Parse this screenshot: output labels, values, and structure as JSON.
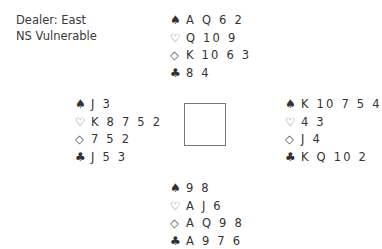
{
  "deal_info": {
    "dealer": "Dealer: East",
    "vulnerability": "NS Vulnerable"
  },
  "suits": {
    "spades": "♠",
    "hearts": "♡",
    "diamonds": "◇",
    "clubs": "♣"
  },
  "hands": {
    "north": {
      "spades": "A Q 6 2",
      "hearts": "Q 10 9",
      "diamonds": "K 10 6 3",
      "clubs": "8 4"
    },
    "west": {
      "spades": "J 3",
      "hearts": "K 8 7 5 2",
      "diamonds": "7 5 2",
      "clubs": "J 5 3"
    },
    "east": {
      "spades": "K 10 7 5 4",
      "hearts": "4 3",
      "diamonds": "J 4",
      "clubs": "K Q 10 2"
    },
    "south": {
      "spades": "9 8",
      "hearts": "A J 6",
      "diamonds": "A Q 9 8",
      "clubs": "A 9 7 6"
    }
  }
}
